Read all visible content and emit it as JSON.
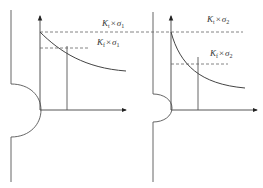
{
  "diagram": {
    "colors": {
      "line": "#555555",
      "dashed": "#666666",
      "text": "#333333"
    },
    "panels": [
      {
        "id": "left",
        "notch": "larger radius",
        "labels": {
          "kt": {
            "K": "K",
            "sub": "t",
            "op": "×",
            "sigma": "σ",
            "sigma_sub": "1"
          },
          "kf": {
            "K": "K",
            "sub": "f",
            "op": "×",
            "sigma": "σ",
            "sigma_sub": "1"
          }
        }
      },
      {
        "id": "right",
        "notch": "smaller radius",
        "labels": {
          "kt": {
            "K": "K",
            "sub": "t",
            "op": "×",
            "sigma": "σ",
            "sigma_sub": "2"
          },
          "kf": {
            "K": "K",
            "sub": "f",
            "op": "×",
            "sigma": "σ",
            "sigma_sub": "2"
          }
        }
      }
    ]
  }
}
